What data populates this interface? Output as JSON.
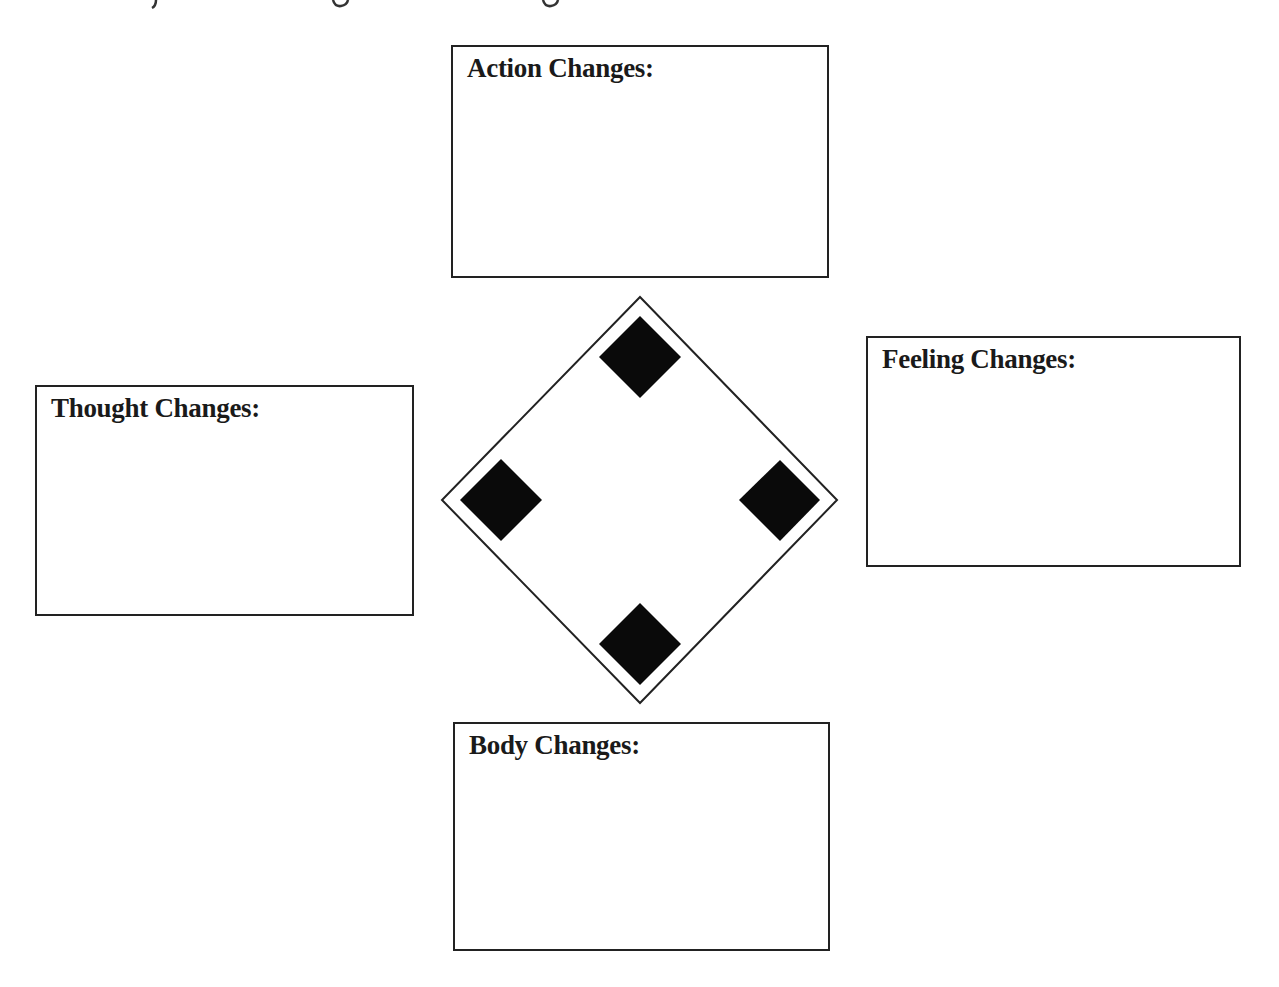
{
  "diagram": {
    "type": "cycle-worksheet",
    "center_shape": "diamond with four filled corner markers",
    "boxes": {
      "top": {
        "label": "Action Changes:",
        "content": ""
      },
      "left": {
        "label": "Thought Changes:",
        "content": ""
      },
      "right": {
        "label": "Feeling Changes:",
        "content": ""
      },
      "bottom": {
        "label": "Body Changes:",
        "content": ""
      }
    },
    "colors": {
      "stroke": "#222222",
      "marker_fill": "#0a0a0a",
      "text": "#1a1a1a",
      "background": "#ffffff"
    }
  }
}
